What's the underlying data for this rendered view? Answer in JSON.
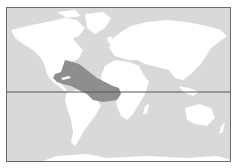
{
  "map": {
    "type": "world-distribution-map",
    "projection": "equirectangular",
    "colors": {
      "ocean": "#d9d9d9",
      "land": "#ffffff",
      "range": "#8e8e8e",
      "equator": "#555555",
      "border": "#6a6a6a"
    },
    "highlighted_region": "tropical-western-atlantic-caribbean-gulf-of-mexico",
    "reference_lines": [
      "equator"
    ]
  }
}
